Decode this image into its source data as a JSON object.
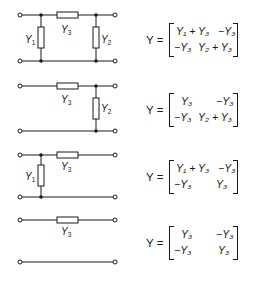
{
  "networks": [
    {
      "name": "pi-network",
      "elements": [
        "Y1",
        "Y3",
        "Y2"
      ],
      "labels": {
        "y1": "Y",
        "y1_sub": "1",
        "y3": "Y",
        "y3_sub": "3",
        "y2": "Y",
        "y2_sub": "2"
      },
      "matrix": {
        "lhs": "Y =",
        "m11": "Y₁ + Y₃",
        "m12": "−Y₃",
        "m21": "−Y₃",
        "m22": "Y₂ + Y₃"
      }
    },
    {
      "name": "series-y3-shunt-y2",
      "elements": [
        "Y3",
        "Y2"
      ],
      "labels": {
        "y3": "Y",
        "y3_sub": "3",
        "y2": "Y",
        "y2_sub": "2"
      },
      "matrix": {
        "lhs": "Y =",
        "m11": "Y₃",
        "m12": "−Y₃",
        "m21": "−Y₃",
        "m22": "Y₂ + Y₃"
      }
    },
    {
      "name": "shunt-y1-series-y3",
      "elements": [
        "Y1",
        "Y3"
      ],
      "labels": {
        "y1": "Y",
        "y1_sub": "1",
        "y3": "Y",
        "y3_sub": "3"
      },
      "matrix": {
        "lhs": "Y =",
        "m11": "Y₁ + Y₃",
        "m12": "−Y₃",
        "m21": "−Y₃",
        "m22": "Y₃"
      }
    },
    {
      "name": "series-y3",
      "elements": [
        "Y3"
      ],
      "labels": {
        "y3": "Y",
        "y3_sub": "3"
      },
      "matrix": {
        "lhs": "Y =",
        "m11": "Y₃",
        "m12": "−Y₃",
        "m21": "−Y₃",
        "m22": "Y₃"
      }
    }
  ],
  "colors": {
    "ink": "#1a1a1a",
    "background": "#ffffff"
  }
}
